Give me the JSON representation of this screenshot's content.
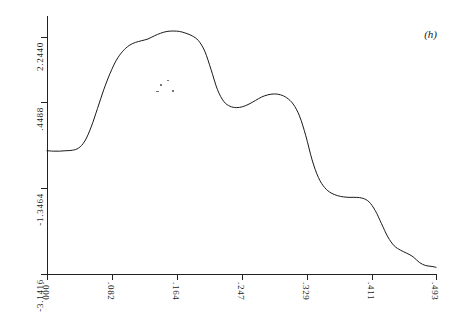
{
  "panel": {
    "label": "(h)"
  },
  "chart_data": {
    "type": "line",
    "title": "",
    "subtitle": "",
    "xlabel": "",
    "ylabel": "",
    "annotations": [
      "(h)"
    ],
    "grid": false,
    "legend": null,
    "axis": {
      "x_ticks": [
        ".000",
        ".082",
        ".164",
        ".247",
        ".329",
        ".411",
        ".493"
      ],
      "x_tick_values": [
        0.0,
        0.082,
        0.164,
        0.247,
        0.329,
        0.411,
        0.493
      ],
      "y_ticks": [
        "-3.1416",
        "-1.3464",
        ".4488",
        "2.2440"
      ],
      "y_tick_values": [
        -3.1416,
        -1.3464,
        0.4488,
        2.244
      ],
      "xlim": [
        0.0,
        0.493
      ],
      "ylim": [
        -3.1416,
        3.1416
      ]
    },
    "series": [
      {
        "name": "signal",
        "x": [
          0.0,
          0.008,
          0.016,
          0.024,
          0.032,
          0.04,
          0.048,
          0.056,
          0.064,
          0.072,
          0.08,
          0.088,
          0.096,
          0.104,
          0.112,
          0.12,
          0.128,
          0.136,
          0.144,
          0.152,
          0.16,
          0.168,
          0.176,
          0.184,
          0.192,
          0.2,
          0.208,
          0.216,
          0.224,
          0.232,
          0.24,
          0.248,
          0.256,
          0.264,
          0.272,
          0.28,
          0.288,
          0.296,
          0.304,
          0.312,
          0.32,
          0.328,
          0.336,
          0.344,
          0.352,
          0.36,
          0.368,
          0.376,
          0.384,
          0.392,
          0.4,
          0.408,
          0.416,
          0.424,
          0.432,
          0.44,
          0.448,
          0.456,
          0.464,
          0.472,
          0.48,
          0.488,
          0.493
        ],
        "y": [
          -0.34,
          -0.35,
          -0.35,
          -0.34,
          -0.33,
          -0.28,
          -0.12,
          0.2,
          0.62,
          1.05,
          1.42,
          1.72,
          1.92,
          2.05,
          2.12,
          2.16,
          2.2,
          2.27,
          2.33,
          2.37,
          2.38,
          2.37,
          2.33,
          2.27,
          2.16,
          1.92,
          1.5,
          1.05,
          0.78,
          0.67,
          0.64,
          0.66,
          0.72,
          0.8,
          0.88,
          0.93,
          0.95,
          0.93,
          0.86,
          0.72,
          0.45,
          0.0,
          -0.55,
          -0.95,
          -1.18,
          -1.3,
          -1.36,
          -1.39,
          -1.4,
          -1.4,
          -1.42,
          -1.5,
          -1.7,
          -2.0,
          -2.3,
          -2.5,
          -2.6,
          -2.67,
          -2.75,
          -2.88,
          -2.95,
          -2.97,
          -2.99
        ]
      }
    ],
    "style": {
      "line_color": "#1a1a1a",
      "line_width": 1,
      "background": "#ffffff"
    }
  }
}
